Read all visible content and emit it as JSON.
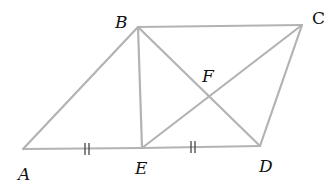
{
  "diagram": {
    "type": "geometry",
    "colors": {
      "line": "#b3b3b3",
      "label": "#111111",
      "tick": "#444444"
    },
    "points": {
      "A": {
        "label": "A",
        "x": 23,
        "y": 149
      },
      "B": {
        "label": "B",
        "x": 138,
        "y": 27
      },
      "C": {
        "label": "C",
        "x": 302,
        "y": 25
      },
      "D": {
        "label": "D",
        "x": 260,
        "y": 146
      },
      "E": {
        "label": "E",
        "x": 142,
        "y": 148
      },
      "F": {
        "label": "F",
        "x": 209,
        "y": 91
      }
    },
    "segments": [
      "AB",
      "BC",
      "CD",
      "AE",
      "ED",
      "BE",
      "BD",
      "EC"
    ],
    "congruence_marks": [
      {
        "segment": "AE",
        "marks": 2
      },
      {
        "segment": "ED",
        "marks": 2
      }
    ],
    "labels": {
      "A": "A",
      "B": "B",
      "C": "C",
      "D": "D",
      "E": "E",
      "F": "F"
    }
  }
}
